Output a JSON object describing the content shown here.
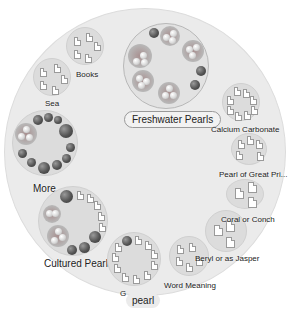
{
  "diagram": {
    "center": "pearl",
    "center_partial_label": "G",
    "nodes": [
      {
        "id": "freshwater",
        "label": "Freshwater Pearls",
        "selected": true
      },
      {
        "id": "books",
        "label": "Books"
      },
      {
        "id": "sea",
        "label": "Sea"
      },
      {
        "id": "more",
        "label": "More..."
      },
      {
        "id": "cultured",
        "label": "Cultured Pearls"
      },
      {
        "id": "calcium",
        "label": "Calcium Carbonate"
      },
      {
        "id": "great-price",
        "label": "Pearl of Great Pri..."
      },
      {
        "id": "coral",
        "label": "Coral or Conch"
      },
      {
        "id": "beryl",
        "label": "Beryl or as Jasper"
      },
      {
        "id": "word",
        "label": "Word Meaning"
      }
    ]
  },
  "colors": {
    "background": "#ffffff",
    "outer_circle": "#ebebeb",
    "node_fill": "#dcdcdc",
    "pearl_dark": "#444444"
  }
}
